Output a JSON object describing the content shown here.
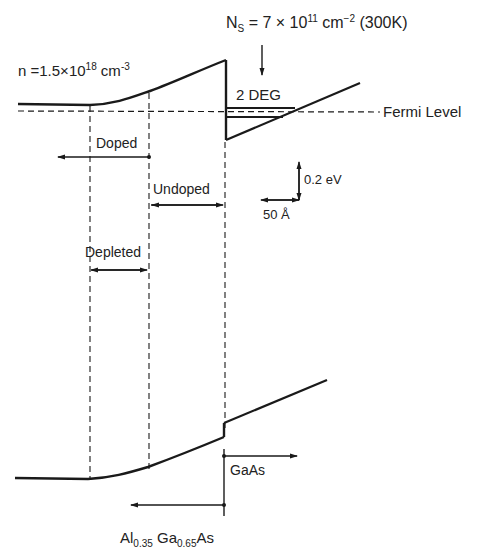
{
  "diagram": {
    "type": "energy-band-diagram",
    "labels": {
      "doping": {
        "prefix": "n =1.5×10",
        "exp": "18",
        "unit": " cm",
        "unit_exp": "-3"
      },
      "ns": {
        "prefix": "N",
        "sub": "S",
        "mid": " = 7 × 10",
        "exp": "11",
        "unit": " cm",
        "unit_exp": "−2",
        "suffix": " (300K)"
      },
      "two_deg": "2 DEG",
      "fermi_level": "Fermi Level",
      "doped": "Doped",
      "undoped": "Undoped",
      "depleted": "Depleted",
      "scale_energy": "0.2 eV",
      "scale_length": "50 Å",
      "gaas": "GaAs",
      "algaas": {
        "al": "Al",
        "al_sub": "0.35",
        "ga": " Ga",
        "ga_sub": "0.65",
        "as": "As"
      }
    },
    "colors": {
      "line": "#1a1a1a",
      "background": "#ffffff"
    }
  }
}
